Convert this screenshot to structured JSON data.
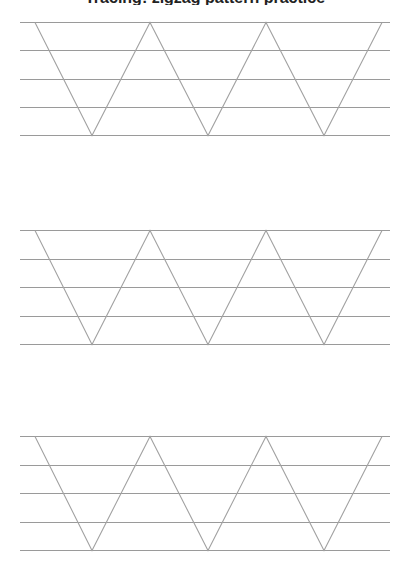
{
  "worksheet": {
    "title_fragment": "Tracing: zigzag pattern practice",
    "line_color": "#9a9a9a",
    "stroke_color": "#a2a2a2",
    "blocks": [
      {
        "label": "practice-row-1",
        "guide_lines_y": [
          22,
          50,
          79,
          107,
          135
        ]
      },
      {
        "label": "practice-row-2",
        "guide_lines_y": [
          230,
          259,
          287,
          316,
          344
        ]
      },
      {
        "label": "practice-row-3",
        "guide_lines_y": [
          436,
          465,
          493,
          522,
          550
        ]
      }
    ],
    "guide_x_range": [
      20,
      390
    ],
    "zigzag_top_points_x": [
      35,
      150,
      266,
      382
    ],
    "zigzag_bottom_points_x": [
      92,
      208,
      324
    ]
  }
}
